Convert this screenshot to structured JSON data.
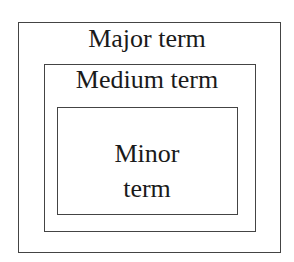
{
  "diagram": {
    "type": "nested-boxes",
    "outer": {
      "label": "Major term"
    },
    "medium": {
      "label": "Medium term"
    },
    "inner": {
      "label_line1": "Minor",
      "label_line2": "term"
    }
  }
}
